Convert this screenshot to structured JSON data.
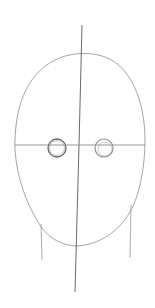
{
  "drawing": {
    "subject": "face-construction-sketch",
    "background": "#ffffff",
    "stroke_color": "#8a8a8a",
    "dark_stroke_color": "#5a5a5a",
    "elements": [
      "head-outline",
      "vertical-center-line",
      "horizontal-eye-line",
      "left-eye-circle",
      "right-eye-circle",
      "left-neck-line",
      "right-neck-line"
    ]
  }
}
